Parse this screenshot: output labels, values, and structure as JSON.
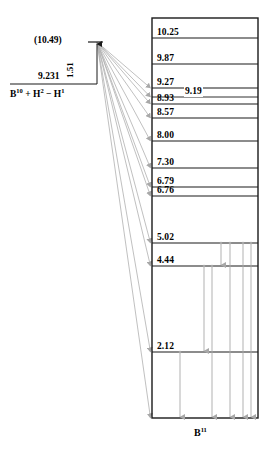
{
  "figure": {
    "nucleus_label": "B",
    "nucleus_mass": "11",
    "width": 276,
    "height": 455
  },
  "left_side": {
    "upper_level_label": "(10.49)",
    "separation_label": "9.231",
    "gap_label": "1.51",
    "reaction_text": "B",
    "reaction_sup1": "10",
    "reaction_mid": " + H",
    "reaction_sup2": "2",
    "reaction_mid2": " − H",
    "reaction_sup3": "1"
  },
  "colors": {
    "level_line": "#1a1a1a",
    "box_border": "#1a1a1a",
    "feed_line": "#b0b0b0",
    "decay_arrow": "#a8a8a8",
    "text": "#000000",
    "background": "#ffffff"
  },
  "chart_data": {
    "type": "diagram",
    "ylabel": "Excitation energy (MeV)",
    "nucleus": "B11",
    "ylim": [
      0,
      10.6
    ],
    "grid": false,
    "legend": false,
    "levels": [
      {
        "energy": "10.25",
        "y": 38,
        "label_x": 157,
        "line_x1": 152,
        "line_x2": 258,
        "fed": false
      },
      {
        "energy": "9.87",
        "y": 64,
        "label_x": 157,
        "line_x1": 152,
        "line_x2": 258,
        "fed": false
      },
      {
        "energy": "9.27",
        "y": 88,
        "label_x": 157,
        "line_x1": 152,
        "line_x2": 258,
        "fed": true
      },
      {
        "energy": "9.19",
        "y": 97,
        "label_x": 184,
        "line_x1": 152,
        "line_x2": 258,
        "fed": true,
        "midline": true
      },
      {
        "energy": "8.93",
        "y": 104,
        "label_x": 157,
        "line_x1": 152,
        "line_x2": 258,
        "fed": true
      },
      {
        "energy": "8.57",
        "y": 118,
        "label_x": 157,
        "line_x1": 152,
        "line_x2": 258,
        "fed": true
      },
      {
        "energy": "8.00",
        "y": 141,
        "label_x": 157,
        "line_x1": 152,
        "line_x2": 258,
        "fed": true
      },
      {
        "energy": "7.30",
        "y": 168,
        "label_x": 157,
        "line_x1": 152,
        "line_x2": 258,
        "fed": true
      },
      {
        "energy": "6.79",
        "y": 187,
        "label_x": 157,
        "line_x1": 152,
        "line_x2": 258,
        "fed": true
      },
      {
        "energy": "6.76",
        "y": 196,
        "label_x": 157,
        "line_x1": 152,
        "line_x2": 258,
        "fed": true
      },
      {
        "energy": "5.02",
        "y": 243,
        "label_x": 157,
        "line_x1": 152,
        "line_x2": 258,
        "fed": true
      },
      {
        "energy": "4.44",
        "y": 266,
        "label_x": 157,
        "line_x1": 152,
        "line_x2": 258,
        "fed": true
      },
      {
        "energy": "2.12",
        "y": 352,
        "label_x": 157,
        "line_x1": 152,
        "line_x2": 258,
        "fed": true
      },
      {
        "energy": "",
        "y": 418,
        "label_x": 157,
        "line_x1": 152,
        "line_x2": 258,
        "fed": true,
        "ground": true
      }
    ],
    "box": {
      "x1": 152,
      "y1": 18,
      "x2": 258,
      "y2": 418
    },
    "feed_origin": {
      "x": 97,
      "y": 42
    },
    "feed_targets_y": [
      88,
      97,
      104,
      118,
      141,
      168,
      187,
      196,
      243,
      266,
      352,
      418
    ],
    "decay_transitions": [
      {
        "x": 221,
        "y_from": 243,
        "y_to": 266
      },
      {
        "x": 230,
        "y_from": 243,
        "y_to": 418
      },
      {
        "x": 243,
        "y_from": 243,
        "y_to": 418
      },
      {
        "x": 251,
        "y_from": 243,
        "y_to": 418
      },
      {
        "x": 204,
        "y_from": 266,
        "y_to": 352
      },
      {
        "x": 212,
        "y_from": 266,
        "y_to": 418
      },
      {
        "x": 180,
        "y_from": 352,
        "y_to": 418
      }
    ]
  }
}
